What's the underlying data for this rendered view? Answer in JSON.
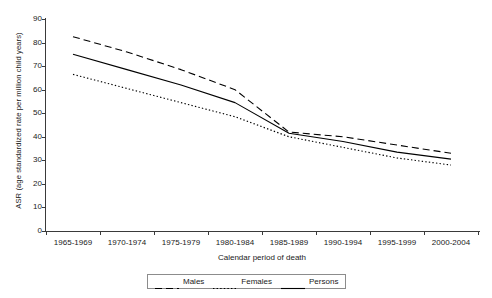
{
  "chart_data": {
    "type": "line",
    "title": "",
    "xlabel": "Calendar period of death",
    "ylabel": "ASR (age standardized rate per million child years)",
    "categories": [
      "1965-1969",
      "1970-1974",
      "1975-1979",
      "1980-1984",
      "1985-1989",
      "1990-1994",
      "1995-1999",
      "2000-2004"
    ],
    "ylim": [
      0,
      90
    ],
    "yticks": [
      0,
      10,
      20,
      30,
      40,
      50,
      60,
      70,
      80,
      90
    ],
    "grid": false,
    "legend_position": "bottom",
    "series": [
      {
        "name": "Males",
        "style": "dashed",
        "color": "#000000",
        "values": [
          82.5,
          76.0,
          68.5,
          60.0,
          42.0,
          40.0,
          36.5,
          33.0
        ]
      },
      {
        "name": "Females",
        "style": "dotted",
        "color": "#000000",
        "values": [
          66.5,
          60.5,
          54.5,
          48.5,
          40.0,
          35.5,
          31.0,
          28.0
        ]
      },
      {
        "name": "Persons",
        "style": "solid",
        "color": "#000000",
        "values": [
          75.0,
          68.5,
          62.0,
          54.5,
          41.5,
          38.0,
          33.5,
          30.5
        ]
      }
    ]
  }
}
